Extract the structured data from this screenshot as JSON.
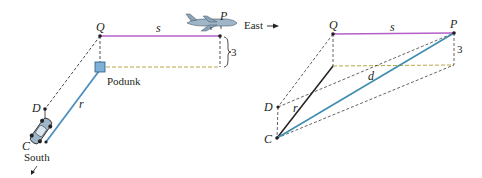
{
  "colors": {
    "s_line": "#b45fc8",
    "r_line": "#4a8fbf",
    "d_line": "#3f8db0",
    "yellow_dash": "#b8a84a",
    "black_dash": "#231f20",
    "r_right": "#231f20",
    "podunk": "#7fb0d8"
  },
  "left_panel": {
    "labels": {
      "Q": "Q",
      "P": "P",
      "s": "s",
      "three": "3",
      "podunk": "Podunk",
      "r": "r",
      "D": "D",
      "C": "C",
      "south": "South",
      "east": "East"
    }
  },
  "right_panel": {
    "labels": {
      "Q": "Q",
      "P": "P",
      "s": "s",
      "three": "3",
      "d": "d",
      "r": "r",
      "D": "D",
      "C": "C"
    }
  }
}
